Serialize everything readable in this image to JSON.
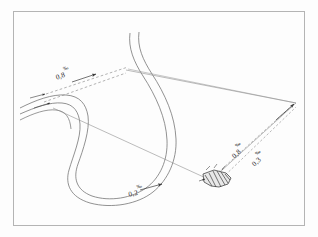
{
  "figure": {
    "background_color": "#fdfdfd",
    "frame_color": "#b4b4b4",
    "line_color": "#6e6e6e",
    "dash_color": "#8a8a8a",
    "structure_color": "#2f2f2f",
    "units_note": "per mille (‰) longitudinal slope"
  },
  "labels": {
    "upper_left_gradient": {
      "value": "0,8",
      "unit": "‰",
      "name": "0,8 ‰"
    },
    "lower_loop_gradient": {
      "value": "0,2",
      "unit": "‰",
      "name": "0,2 ‰"
    },
    "right_upper_gradient": {
      "value": "0,8",
      "unit": "‰",
      "name": "0,8 ‰"
    },
    "right_lower_gradient": {
      "value": "0,3",
      "unit": "‰",
      "name": "0,3 ‰"
    }
  },
  "elements": {
    "watercourse": "meandering double-bank channel",
    "sight_lines": "straight survey lines converging to right apex",
    "dashed_gradient_lines": "dashed slope lines with direction arrows",
    "hydraulic_structure": "hatched weir / lock structure symbol"
  }
}
